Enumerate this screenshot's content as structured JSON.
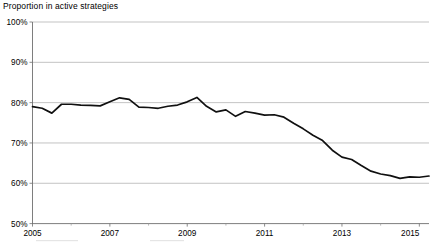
{
  "chart_data": {
    "type": "line",
    "title": "Proportion in active strategies",
    "xlabel": "",
    "ylabel": "",
    "ylim": [
      50,
      100
    ],
    "xlim": [
      2005,
      2015.25
    ],
    "grid": true,
    "legend_position": "none",
    "y_tick_labels": [
      "50%",
      "60%",
      "70%",
      "80%",
      "90%",
      "100%"
    ],
    "y_tick_values": [
      50,
      60,
      70,
      80,
      90,
      100
    ],
    "x_tick_labels": [
      "2005",
      "2007",
      "2009",
      "2011",
      "2013",
      "2015"
    ],
    "x_tick_values": [
      2005,
      2007,
      2009,
      2011,
      2013,
      2015
    ],
    "x_minor_tick_values": [
      2006,
      2008,
      2010,
      2012,
      2014
    ],
    "series": [
      {
        "name": "Proportion in active strategies",
        "color": "#101010",
        "x": [
          2005.0,
          2005.25,
          2005.5,
          2005.75,
          2006.0,
          2006.25,
          2006.5,
          2006.75,
          2007.0,
          2007.25,
          2007.5,
          2007.75,
          2008.0,
          2008.25,
          2008.5,
          2008.75,
          2009.0,
          2009.25,
          2009.5,
          2009.75,
          2010.0,
          2010.25,
          2010.5,
          2010.75,
          2011.0,
          2011.25,
          2011.5,
          2011.75,
          2012.0,
          2012.25,
          2012.5,
          2012.75,
          2013.0,
          2013.25,
          2013.5,
          2013.75,
          2014.0,
          2014.25,
          2014.5,
          2014.75,
          2015.0,
          2015.25
        ],
        "values": [
          79.0,
          78.6,
          77.4,
          79.6,
          79.6,
          79.4,
          79.3,
          79.2,
          80.2,
          81.2,
          80.8,
          78.9,
          78.8,
          78.6,
          79.1,
          79.4,
          80.2,
          81.3,
          79.1,
          77.7,
          78.2,
          76.6,
          77.8,
          77.4,
          76.9,
          77.0,
          76.4,
          74.9,
          73.5,
          71.9,
          70.6,
          68.2,
          66.5,
          65.9,
          64.4,
          63.0,
          62.3,
          61.9,
          61.2,
          61.6,
          61.5,
          61.8
        ]
      }
    ],
    "annotations": []
  }
}
